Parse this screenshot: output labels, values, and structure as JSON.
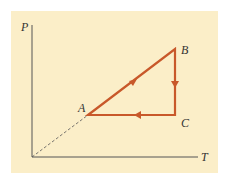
{
  "diagram": {
    "axes": {
      "x_label": "T",
      "y_label": "P"
    },
    "points": [
      {
        "label": "A",
        "x": 88,
        "y": 115
      },
      {
        "label": "B",
        "x": 175,
        "y": 49
      },
      {
        "label": "C",
        "x": 175,
        "y": 115
      }
    ],
    "paths": [
      {
        "from": "A",
        "to": "B",
        "direction": "forward"
      },
      {
        "from": "B",
        "to": "C",
        "direction": "forward"
      },
      {
        "from": "C",
        "to": "A",
        "direction": "forward"
      }
    ],
    "colors": {
      "background": "#fbeec8",
      "cycle": "#c8582a",
      "axis": "#555555"
    }
  }
}
